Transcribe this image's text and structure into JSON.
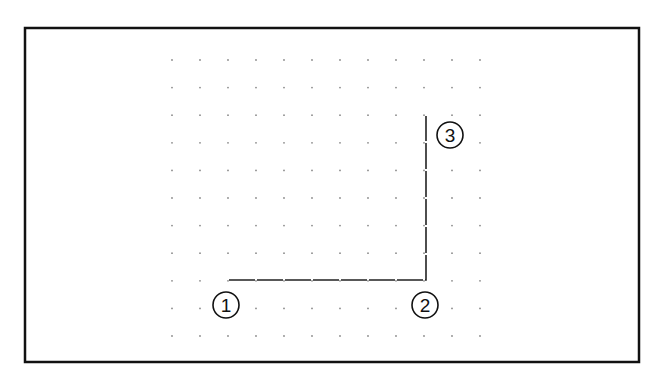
{
  "frame": {
    "x": 25,
    "y": 28,
    "width": 614,
    "height": 334,
    "stroke": "#111111"
  },
  "grid": {
    "x0": 172,
    "y0": 60,
    "dx": 28,
    "dy": 27.6,
    "cols": 12,
    "rows": 11,
    "dot_color": "#8a8a8a"
  },
  "path": {
    "stroke": "#222222",
    "points": [
      [
        229,
        280
      ],
      [
        426,
        280
      ],
      [
        426,
        116
      ]
    ]
  },
  "markers": [
    {
      "id": "1",
      "label": "1",
      "cx": 226,
      "cy": 305
    },
    {
      "id": "2",
      "label": "2",
      "cx": 425,
      "cy": 305
    },
    {
      "id": "3",
      "label": "3",
      "cx": 450,
      "cy": 135
    }
  ]
}
